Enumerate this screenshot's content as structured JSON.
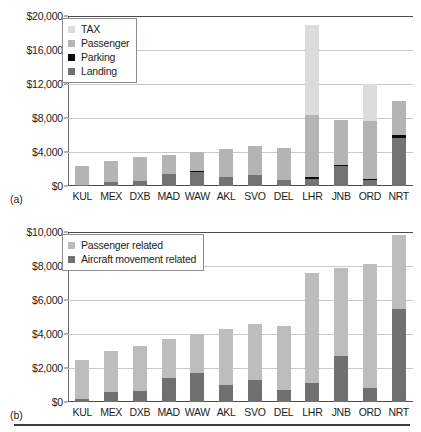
{
  "figure": {
    "panels": [
      {
        "letter": "(a)",
        "legend_position": "top-left-inside"
      },
      {
        "letter": "(b)",
        "legend_position": "top-left-inside"
      }
    ]
  },
  "colors": {
    "tax": "#dcdcdc",
    "passenger": "#b4b4b4",
    "parking": "#0d0d0d",
    "landing": "#737373",
    "passenger_related": "#bdbdbd",
    "aircraft_movement_related": "#707070",
    "gridline": "#c9c9c9",
    "axis": "#4a4a4a",
    "text": "#1d1d1d",
    "legend_border": "#8c8c8c",
    "background": "#ffffff"
  },
  "chart_data": [
    {
      "type": "bar",
      "id": "panel-a",
      "panel_label": "(a)",
      "title": "",
      "xlabel": "",
      "ylabel": "",
      "stacked": true,
      "grid": true,
      "legend_position": "upper left",
      "ylim": [
        0,
        20000
      ],
      "yticks": [
        0,
        4000,
        8000,
        12000,
        16000,
        20000
      ],
      "ytick_labels": [
        "$0",
        "$4,000",
        "$8,000",
        "$12,000",
        "$16,000",
        "$20,000"
      ],
      "categories": [
        "KUL",
        "MEX",
        "DXB",
        "MAD",
        "WAW",
        "AKL",
        "SVO",
        "DEL",
        "LHR",
        "JNB",
        "ORD",
        "NRT"
      ],
      "series": [
        {
          "name": "Landing",
          "color": "#737373",
          "values": [
            100,
            450,
            550,
            1400,
            1700,
            1050,
            1300,
            700,
            800,
            2400,
            750,
            5700
          ]
        },
        {
          "name": "Parking",
          "color": "#0d0d0d",
          "values": [
            30,
            40,
            40,
            50,
            50,
            40,
            40,
            40,
            250,
            40,
            40,
            300
          ]
        },
        {
          "name": "Passenger",
          "color": "#b4b4b4",
          "values": [
            2270,
            2510,
            2810,
            2250,
            2250,
            3210,
            3360,
            3760,
            7350,
            5360,
            6910,
            4000
          ]
        },
        {
          "name": "TAX",
          "color": "#dcdcdc",
          "values": [
            0,
            0,
            0,
            0,
            0,
            0,
            0,
            0,
            10600,
            0,
            4300,
            0
          ]
        }
      ],
      "totals": [
        2400,
        3000,
        3400,
        3700,
        4000,
        4300,
        4700,
        4500,
        19000,
        7800,
        12000,
        10000
      ]
    },
    {
      "type": "bar",
      "id": "panel-b",
      "panel_label": "(b)",
      "title": "",
      "xlabel": "",
      "ylabel": "",
      "stacked": true,
      "grid": true,
      "legend_position": "upper left",
      "ylim": [
        0,
        10000
      ],
      "yticks": [
        0,
        2000,
        4000,
        6000,
        8000,
        10000
      ],
      "ytick_labels": [
        "$0",
        "$2,000",
        "$4,000",
        "$6,000",
        "$8,000",
        "$10,000"
      ],
      "categories": [
        "KUL",
        "MEX",
        "DXB",
        "MAD",
        "WAW",
        "AKL",
        "SVO",
        "DEL",
        "LHR",
        "JNB",
        "ORD",
        "NRT"
      ],
      "series": [
        {
          "name": "Aircraft movement related",
          "color": "#707070",
          "values": [
            180,
            600,
            620,
            1400,
            1700,
            1000,
            1300,
            700,
            1100,
            2700,
            800,
            5500
          ]
        },
        {
          "name": "Passenger related",
          "color": "#bdbdbd",
          "values": [
            2320,
            2400,
            2680,
            2300,
            2300,
            3300,
            3300,
            3800,
            6500,
            5200,
            7300,
            4300
          ]
        }
      ],
      "totals": [
        2500,
        3000,
        3300,
        3700,
        4000,
        4300,
        4600,
        4500,
        7600,
        7900,
        8100,
        9800
      ]
    }
  ],
  "panel_a": {
    "legend": [
      {
        "label": "TAX",
        "swatch": "#dcdcdc"
      },
      {
        "label": "Passenger",
        "swatch": "#b4b4b4"
      },
      {
        "label": "Parking",
        "swatch": "#0d0d0d"
      },
      {
        "label": "Landing",
        "swatch": "#737373"
      }
    ]
  },
  "panel_b": {
    "legend": [
      {
        "label": "Passenger related",
        "swatch": "#bdbdbd"
      },
      {
        "label": "Aircraft movement related",
        "swatch": "#707070"
      }
    ]
  }
}
